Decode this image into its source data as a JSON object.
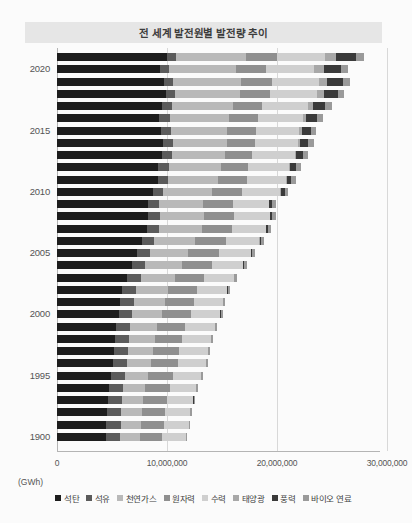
{
  "title": "전 세계 발전원별 발전량 추이",
  "unit_label": "(GWh)",
  "axis": {
    "x_ticks": [
      "0",
      "10,000,000",
      "20,000,000",
      "30,000,000"
    ],
    "y_ticks": [
      "2020",
      "2015",
      "2010",
      "2005",
      "2000",
      "1995",
      "1900"
    ]
  },
  "legend": [
    {
      "label": "석탄",
      "color": "#1d1d1d"
    },
    {
      "label": "석유",
      "color": "#5b5b5b"
    },
    {
      "label": "천연가스",
      "color": "#b9b9b9"
    },
    {
      "label": "원자력",
      "color": "#8f8f8f"
    },
    {
      "label": "수력",
      "color": "#cfcfcf"
    },
    {
      "label": "태양광",
      "color": "#a8a8a8"
    },
    {
      "label": "풍력",
      "color": "#3a3a3a"
    },
    {
      "label": "바이오 연료",
      "color": "#9a9a9a"
    }
  ],
  "chart_data": {
    "type": "bar",
    "orientation": "horizontal",
    "stacked": true,
    "title": "전 세계 발전원별 발전량 추이",
    "xlabel": "(GWh)",
    "ylabel": "",
    "xlim": [
      0,
      32000000
    ],
    "x_ticks": [
      0,
      10000000,
      20000000,
      30000000
    ],
    "grid": true,
    "legend_position": "bottom",
    "categories": [
      "1990",
      "1991",
      "1992",
      "1993",
      "1994",
      "1995",
      "1996",
      "1997",
      "1998",
      "1999",
      "2000",
      "2001",
      "2002",
      "2003",
      "2004",
      "2005",
      "2006",
      "2007",
      "2008",
      "2009",
      "2010",
      "2011",
      "2012",
      "2013",
      "2014",
      "2015",
      "2016",
      "2017",
      "2018",
      "2019",
      "2020",
      "2021"
    ],
    "series": [
      {
        "name": "석탄",
        "color": "#1d1d1d",
        "values": [
          4430000,
          4480000,
          4520000,
          4650000,
          4740000,
          4900000,
          5100000,
          5200000,
          5250000,
          5350000,
          5600000,
          5750000,
          5950000,
          6400000,
          6850000,
          7300000,
          7750000,
          8150000,
          8300000,
          8250000,
          8700000,
          9150000,
          9200000,
          9500000,
          9600000,
          9450000,
          9300000,
          9550000,
          9900000,
          9700000,
          9400000,
          10000000
        ]
      },
      {
        "name": "석유",
        "color": "#5b5b5b",
        "values": [
          1340000,
          1330000,
          1320000,
          1300000,
          1290000,
          1280000,
          1290000,
          1280000,
          1290000,
          1280000,
          1250000,
          1230000,
          1200000,
          1200000,
          1180000,
          1150000,
          1100000,
          1080000,
          1030000,
          980000,
          960000,
          940000,
          1000000,
          980000,
          960000,
          940000,
          930000,
          900000,
          870000,
          820000,
          760000,
          780000
        ]
      },
      {
        "name": "천연가스",
        "color": "#b9b9b9",
        "values": [
          1750000,
          1800000,
          1850000,
          1900000,
          1980000,
          2080000,
          2180000,
          2250000,
          2350000,
          2500000,
          2700000,
          2800000,
          2950000,
          3100000,
          3300000,
          3500000,
          3700000,
          3950000,
          4050000,
          4050000,
          4400000,
          4550000,
          4750000,
          4800000,
          4900000,
          5100000,
          5400000,
          5550000,
          5900000,
          6200000,
          6150000,
          6400000
        ]
      },
      {
        "name": "원자력",
        "color": "#8f8f8f",
        "values": [
          2000000,
          2100000,
          2120000,
          2180000,
          2240000,
          2330000,
          2420000,
          2400000,
          2450000,
          2550000,
          2600000,
          2640000,
          2660000,
          2640000,
          2740000,
          2770000,
          2790000,
          2740000,
          2730000,
          2700000,
          2760000,
          2620000,
          2460000,
          2480000,
          2540000,
          2570000,
          2610000,
          2640000,
          2710000,
          2790000,
          2700000,
          2800000
        ]
      },
      {
        "name": "수력",
        "color": "#cfcfcf",
        "values": [
          2190000,
          2250000,
          2290000,
          2380000,
          2400000,
          2500000,
          2570000,
          2590000,
          2650000,
          2660000,
          2700000,
          2650000,
          2700000,
          2720000,
          2840000,
          2930000,
          3070000,
          3100000,
          3250000,
          3300000,
          3500000,
          3550000,
          3720000,
          3850000,
          3950000,
          3950000,
          4100000,
          4200000,
          4300000,
          4350000,
          4400000,
          4350000
        ]
      },
      {
        "name": "태양광",
        "color": "#a8a8a8",
        "values": [
          400,
          500,
          600,
          700,
          800,
          900,
          1000,
          1100,
          1300,
          1500,
          1800,
          2200,
          2700,
          3300,
          4200,
          5400,
          7000,
          9000,
          12000,
          20000,
          32000,
          64000,
          100000,
          140000,
          190000,
          250000,
          330000,
          440000,
          570000,
          700000,
          840000,
          1020000
        ]
      },
      {
        "name": "풍력",
        "color": "#3a3a3a",
        "values": [
          3600,
          4300,
          5100,
          6200,
          7500,
          8700,
          10000,
          12000,
          15000,
          20000,
          31000,
          38000,
          52000,
          63000,
          85000,
          104000,
          133000,
          170000,
          220000,
          270000,
          342000,
          434000,
          530000,
          640000,
          710000,
          830000,
          960000,
          1130000,
          1270000,
          1420000,
          1590000,
          1860000
        ]
      },
      {
        "name": "바이오 연료",
        "color": "#9a9a9a",
        "values": [
          130000,
          135000,
          140000,
          145000,
          150000,
          158000,
          165000,
          172000,
          180000,
          188000,
          196000,
          205000,
          215000,
          225000,
          240000,
          255000,
          272000,
          290000,
          310000,
          330000,
          355000,
          385000,
          420000,
          450000,
          480000,
          505000,
          530000,
          560000,
          590000,
          620000,
          640000,
          680000
        ]
      }
    ]
  },
  "geometry": {
    "x0_px": 57,
    "px_per_unit": 1.1e-05,
    "top_px": 53,
    "row_step_px": 12.25,
    "bar_height_px": 8,
    "axis_bottom_px": 451
  }
}
